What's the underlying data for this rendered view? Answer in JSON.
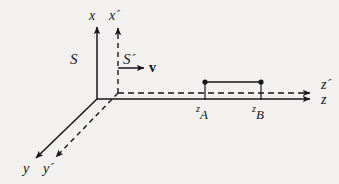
{
  "figure": {
    "kind": "relativity-reference-frames-diagram",
    "background_color": "#f2f1ef",
    "ink_color": "#16161a",
    "width": 339,
    "height": 184
  },
  "axes": {
    "x": {
      "label": "x",
      "style": "solid",
      "direction": "up",
      "origin": [
        97,
        99
      ],
      "tip": [
        97,
        24
      ]
    },
    "x_prime": {
      "label": "x´",
      "style": "dashed",
      "direction": "up",
      "origin": [
        118,
        93
      ],
      "tip": [
        118,
        25
      ]
    },
    "y": {
      "label": "y",
      "style": "solid",
      "direction": "down-left",
      "origin": [
        97,
        99
      ],
      "tip": [
        32,
        162
      ]
    },
    "y_prime": {
      "label": "y´",
      "style": "dashed",
      "direction": "down-left",
      "origin": [
        118,
        93
      ],
      "tip": [
        52,
        162
      ]
    },
    "z": {
      "label": "z",
      "style": "solid",
      "direction": "right",
      "origin": [
        97,
        99
      ],
      "tip": [
        313,
        99
      ]
    },
    "z_prime": {
      "label": "z´",
      "style": "dashed",
      "direction": "right",
      "origin": [
        118,
        93
      ],
      "tip": [
        313,
        93
      ]
    }
  },
  "frames": {
    "rest": {
      "label": "S",
      "position": [
        72,
        60
      ]
    },
    "moving": {
      "label": "S´",
      "position": [
        124,
        60
      ]
    }
  },
  "velocity": {
    "label": "v",
    "bold": true,
    "start": [
      118,
      68
    ],
    "end": [
      146,
      68
    ],
    "label_position": [
      150,
      66
    ]
  },
  "rod": {
    "style": "solid-segment-with-endpoint-dots",
    "left_endpoint": {
      "x": 205,
      "y": 82,
      "tick_to_y": 99,
      "label_base": "z",
      "label_sub": "A",
      "label_position": [
        196,
        110
      ]
    },
    "right_endpoint": {
      "x": 261,
      "y": 82,
      "tick_to_y": 99,
      "label_base": "z",
      "label_sub": "B",
      "label_position": [
        252,
        110
      ]
    }
  },
  "axis_labels": {
    "x": {
      "text": "x",
      "position": [
        89,
        10
      ]
    },
    "x_prime": {
      "text": "x´",
      "position": [
        110,
        10
      ]
    },
    "y": {
      "text": "y",
      "position": [
        24,
        163
      ]
    },
    "y_prime": {
      "text": "y´",
      "position": [
        44,
        163
      ]
    },
    "z_prime": {
      "text": "z´",
      "position": [
        322,
        80
      ]
    },
    "z": {
      "text": "z",
      "position": [
        322,
        95
      ]
    }
  }
}
